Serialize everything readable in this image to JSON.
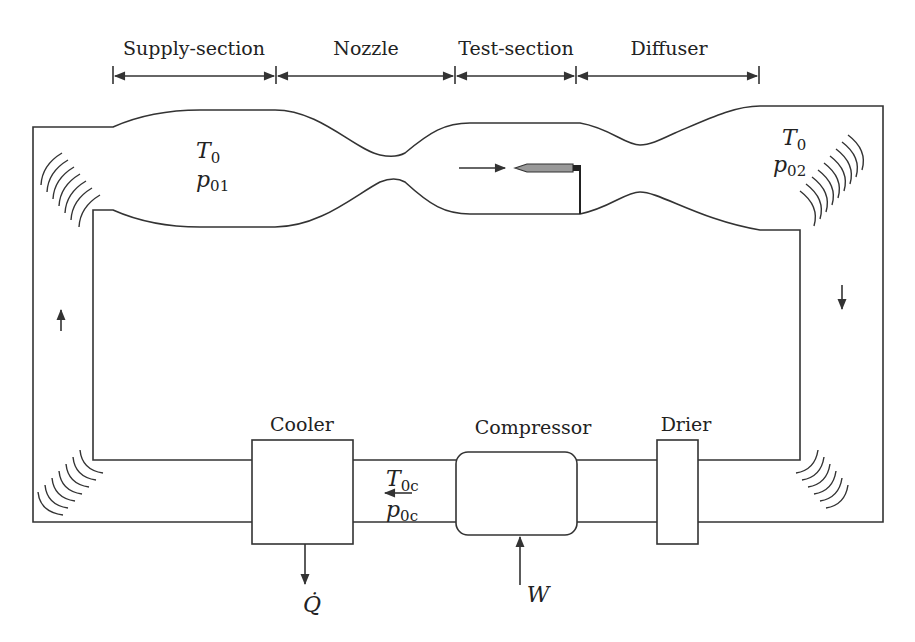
{
  "diagram": {
    "sections": [
      {
        "label": "Supply-section",
        "x1": 113,
        "x2": 276
      },
      {
        "label": "Nozzle",
        "x1": 276,
        "x2": 455
      },
      {
        "label": "Test-section",
        "x1": 455,
        "x2": 576
      },
      {
        "label": "Diffuser",
        "x1": 576,
        "x2": 759
      }
    ],
    "supply_state": {
      "T": "T",
      "T_sub": "0",
      "p": "p",
      "p_sub": "01"
    },
    "diffuser_state": {
      "T": "T",
      "T_sub": "0",
      "p": "p",
      "p_sub": "02"
    },
    "return_state": {
      "T": "T",
      "T_sub": "0c",
      "p": "p",
      "p_sub": "0c"
    },
    "components": {
      "cooler": {
        "label": "Cooler",
        "output": "Q̇"
      },
      "compressor": {
        "label": "Compressor",
        "input": "W"
      },
      "drier": {
        "label": "Drier"
      }
    },
    "flow_arrows": [
      "up-left-leg",
      "down-right-leg",
      "left-return",
      "right-test-section"
    ],
    "colors": {
      "line": "#333333",
      "probe": "#999999",
      "background": "#ffffff"
    }
  }
}
